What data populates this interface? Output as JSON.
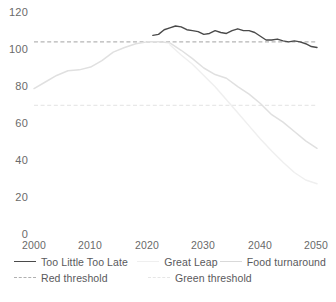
{
  "chart_data": {
    "type": "line",
    "title": "",
    "xlabel": "",
    "ylabel": "",
    "xlim": [
      2000,
      2050
    ],
    "ylim": [
      0,
      120
    ],
    "grid": false,
    "legend_position": "bottom",
    "x_ticks": [
      "2000",
      "2010",
      "2020",
      "2030",
      "2040",
      "2050"
    ],
    "y_ticks": [
      "0",
      "20",
      "40",
      "60",
      "80",
      "100",
      "120"
    ],
    "series": [
      {
        "name": "Too Little Too Late",
        "color": "#4a4a4a",
        "style": "solid",
        "width": 1.4,
        "x": [
          2021,
          2022,
          2023,
          2024,
          2025,
          2026,
          2027,
          2028,
          2029,
          2030,
          2031,
          2032,
          2033,
          2034,
          2035,
          2036,
          2037,
          2038,
          2039,
          2040,
          2041,
          2042,
          2043,
          2044,
          2045,
          2046,
          2047,
          2048,
          2049,
          2050
        ],
        "values": [
          107.5,
          108.0,
          110.5,
          111.5,
          112.5,
          112.0,
          110.5,
          110.0,
          109.5,
          108.0,
          108.5,
          110.0,
          109.0,
          108.5,
          110.0,
          111.0,
          110.0,
          110.0,
          109.0,
          107.0,
          105.0,
          105.0,
          105.5,
          104.5,
          104.0,
          104.5,
          104.0,
          103.0,
          101.5,
          101.0
        ]
      },
      {
        "name": "Great Leap",
        "color": "#efefef",
        "style": "solid",
        "width": 1.4,
        "x": [
          2024,
          2026,
          2028,
          2030,
          2032,
          2034,
          2036,
          2038,
          2040,
          2042,
          2044,
          2046,
          2048,
          2050
        ],
        "values": [
          102.5,
          97.0,
          92.0,
          86.0,
          80.0,
          73.0,
          66.0,
          59.0,
          52.0,
          45.5,
          39.5,
          34.0,
          30.0,
          28.0
        ]
      },
      {
        "name": "Food turnaround",
        "color": "#e0e0e0",
        "style": "solid",
        "width": 1.5,
        "x": [
          2000,
          2002,
          2004,
          2006,
          2008,
          2010,
          2012,
          2014,
          2016,
          2018,
          2020,
          2022,
          2024,
          2026,
          2028,
          2030,
          2032,
          2034,
          2036,
          2038,
          2040,
          2042,
          2044,
          2046,
          2048,
          2050
        ],
        "values": [
          79.0,
          82.5,
          86.0,
          88.5,
          89.0,
          90.5,
          94.0,
          98.5,
          101.0,
          103.0,
          104.0,
          104.0,
          103.5,
          99.5,
          95.0,
          90.0,
          86.5,
          84.5,
          80.0,
          76.0,
          71.0,
          65.0,
          61.0,
          56.0,
          51.0,
          47.0
        ]
      }
    ],
    "thresholds": [
      {
        "name": "Red threshold",
        "value": 104,
        "color": "#b5b5b5",
        "style": "dashed"
      },
      {
        "name": "Green threshold",
        "value": 70,
        "color": "#e8e8e8",
        "style": "dashed"
      }
    ]
  },
  "legend": {
    "rows": [
      [
        {
          "label": "Too Little Too Late",
          "color": "#4a4a4a",
          "style": "solid"
        },
        {
          "label": "Great Leap",
          "color": "#efefef",
          "style": "solid"
        },
        {
          "label": "Food turnaround",
          "color": "#d9d9d9",
          "style": "solid"
        }
      ],
      [
        {
          "label": "Red threshold",
          "color": "#b0b0b0",
          "style": "dashed"
        },
        {
          "label": "Green threshold",
          "color": "#e6e6e6",
          "style": "dashed"
        }
      ]
    ]
  },
  "axes": {
    "y_labels": [
      "120",
      "100",
      "80",
      "60",
      "40",
      "20",
      "0"
    ],
    "x_labels": [
      "2000",
      "2010",
      "2020",
      "2030",
      "2040",
      "2050"
    ]
  }
}
